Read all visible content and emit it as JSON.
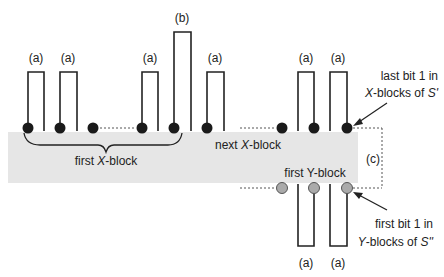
{
  "diagram": {
    "band": {
      "color": "#e6e6e6",
      "x": 8,
      "y": 132,
      "w": 350,
      "h": 51
    },
    "labels": {
      "first_x_block": {
        "prefix": "first ",
        "italic": "X",
        "suffix": "-block"
      },
      "next_x_block": {
        "prefix": "next ",
        "italic": "X",
        "suffix": "-block"
      },
      "first_y_block": "first Y-block",
      "c": "(c)",
      "last_bit_line1": "last bit 1 in",
      "last_bit_line2": {
        "italic": "X",
        "mid": "-blocks of ",
        "italic2": "S'"
      },
      "first_bit_line1": "first bit 1 in",
      "first_bit_line2": {
        "italic": "Y",
        "mid": "-blocks of ",
        "italic2": "S''"
      }
    },
    "top_pulses": [
      {
        "label": "(a)",
        "left": 28,
        "right": 44,
        "top": 72,
        "dot": "left"
      },
      {
        "label": "(a)",
        "left": 60,
        "right": 77,
        "top": 72,
        "dot": "left"
      },
      {
        "label": "(a)",
        "left": 142,
        "right": 158,
        "top": 72,
        "dot": "left"
      },
      {
        "label": "(b)",
        "left": 174,
        "right": 191,
        "top": 32,
        "dot": "left"
      },
      {
        "label": "(a)",
        "left": 207,
        "right": 224,
        "top": 72,
        "dot": "left"
      },
      {
        "label": "(a)",
        "left": 298,
        "right": 314,
        "top": 72,
        "dot": "right"
      },
      {
        "label": "(a)",
        "left": 330,
        "right": 347,
        "top": 72,
        "dot": "right"
      }
    ],
    "bottom_pulses": [
      {
        "label": "(a)",
        "left": 298,
        "right": 314,
        "bottom": 246
      },
      {
        "label": "(a)",
        "left": 330,
        "right": 347,
        "bottom": 246
      }
    ],
    "top_dots_x": [
      28,
      60,
      93,
      142,
      174,
      207,
      282,
      314,
      347
    ],
    "bottom_dots_x": [
      282,
      314,
      347
    ],
    "colors": {
      "line": "#222222",
      "dot_top": "#1a1a1a",
      "dot_bottom": "#aaaaaa",
      "dotted": "#555555"
    }
  }
}
